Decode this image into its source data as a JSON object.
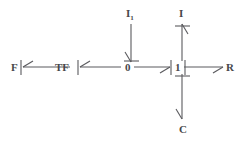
{
  "diagram": {
    "background_color": "#ffffff",
    "stroke_color": "#5a5a5e",
    "text_color": "#47474a",
    "elements": {
      "effort_source": {
        "label": "F",
        "x": 11,
        "y": 69
      },
      "transformer": {
        "label": "TF",
        "x": 61,
        "y": 69
      },
      "zero_junction": {
        "label": "0",
        "x": 127,
        "y": 69
      },
      "one_junction": {
        "label": "1",
        "x": 177,
        "y": 69
      },
      "resistor": {
        "label": "R",
        "x": 228,
        "y": 69
      },
      "inertia_left": {
        "label": "I",
        "sub": "1",
        "x": 129,
        "y": 13
      },
      "inertia_right": {
        "label": "I",
        "sub": "",
        "x": 180,
        "y": 13
      },
      "capacitor": {
        "label": "C",
        "x": 180,
        "y": 129
      }
    },
    "bonds": [
      {
        "name": "bond-tf-to-f",
        "from": "TF",
        "to": "F",
        "direction": "left"
      },
      {
        "name": "bond-zero-to-tf",
        "from": "0",
        "to": "TF",
        "direction": "left"
      },
      {
        "name": "bond-zero-to-one",
        "from": "0",
        "to": "1",
        "direction": "right"
      },
      {
        "name": "bond-one-to-r",
        "from": "1",
        "to": "R",
        "direction": "right"
      },
      {
        "name": "bond-il-to-zero",
        "from": "I1",
        "to": "0",
        "direction": "down"
      },
      {
        "name": "bond-one-to-i",
        "from": "1",
        "to": "I",
        "direction": "up"
      },
      {
        "name": "bond-one-to-c",
        "from": "1",
        "to": "C",
        "direction": "down"
      }
    ]
  }
}
